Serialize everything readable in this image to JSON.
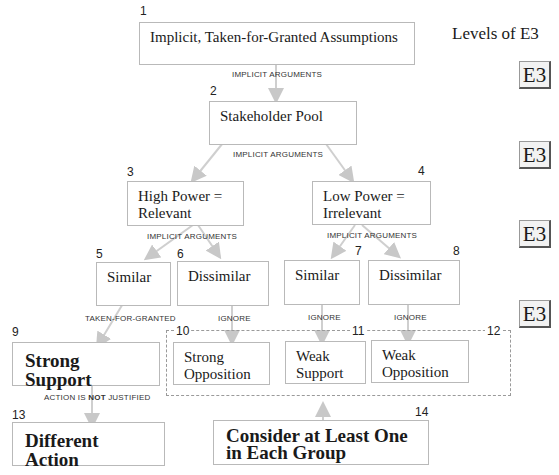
{
  "legend": {
    "title": "Levels of E3",
    "badge": "E3",
    "badge_count": 4
  },
  "nodes": {
    "n1": {
      "num": "1",
      "text": "Implicit, Taken-for-Granted Assumptions"
    },
    "n2": {
      "num": "2",
      "text": "Stakeholder Pool"
    },
    "n3": {
      "num": "3",
      "text": "High Power = Relevant"
    },
    "n4": {
      "num": "4",
      "text": "Low Power = Irrelevant"
    },
    "n5": {
      "num": "5",
      "text": "Similar"
    },
    "n6": {
      "num": "6",
      "text": "Dissimilar"
    },
    "n7": {
      "num": "7",
      "text": "Similar"
    },
    "n8": {
      "num": "8",
      "text": "Dissimilar"
    },
    "n9": {
      "num": "9",
      "text": "Strong Support"
    },
    "n10": {
      "num": "10",
      "text": "Strong Opposition"
    },
    "n11": {
      "num": "11",
      "text": "Weak Support"
    },
    "n12": {
      "num": "12",
      "text": "Weak Opposition"
    },
    "n13": {
      "num": "13",
      "text": "Different Action"
    },
    "n14": {
      "num": "14",
      "text": "Consider at Least One in Each Group"
    }
  },
  "edge_labels": {
    "e1": "IMPLICIT ARGUMENTS",
    "e2": "IMPLICIT ARGUMENTS",
    "e3": "IMPLICIT ARGUMENTS",
    "e4": "IMPLICIT ARGUMENTS",
    "e5": "TAKEN-FOR-GRANTED",
    "e6": "IGNORE",
    "e7": "IGNORE",
    "e8": "IGNORE",
    "e9_pre": "ACTION IS ",
    "e9_bold": "NOT",
    "e9_post": " JUSTIFIED"
  }
}
